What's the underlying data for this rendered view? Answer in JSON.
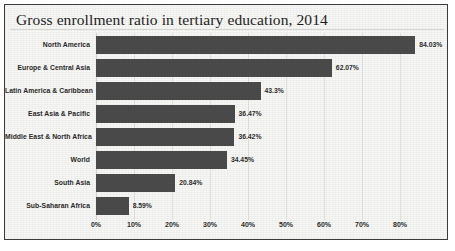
{
  "figure": {
    "title": "Gross enrollment ratio in tertiary education, 2014",
    "bar_color": "#4b4b4b",
    "background_color": "#f8f8f6",
    "border_color": "#3c3c3c",
    "gridline_color": "#e3e3e0"
  },
  "chart_data": {
    "type": "bar",
    "orientation": "horizontal",
    "title": "Gross enrollment ratio in tertiary education, 2014",
    "xlabel": "",
    "ylabel": "",
    "xlim": [
      0,
      88
    ],
    "grid": true,
    "legend": false,
    "categories": [
      "North America",
      "Europe & Central Asia",
      "Latin America & Caribbean",
      "East Asia & Pacific",
      "Middle East & North Africa",
      "World",
      "South Asia",
      "Sub-Saharan Africa"
    ],
    "values": [
      84.03,
      62.07,
      43.3,
      36.47,
      36.42,
      34.45,
      20.84,
      8.59
    ],
    "value_labels": [
      "84.03%",
      "62.07%",
      "43.3%",
      "36.47%",
      "36.42%",
      "34.45%",
      "20.84%",
      "8.59%"
    ],
    "xticks": [
      0,
      10,
      20,
      30,
      40,
      50,
      60,
      70,
      80
    ],
    "xtick_labels": [
      "0%",
      "10%",
      "20%",
      "30%",
      "40%",
      "50%",
      "60%",
      "70%",
      "80%"
    ]
  }
}
